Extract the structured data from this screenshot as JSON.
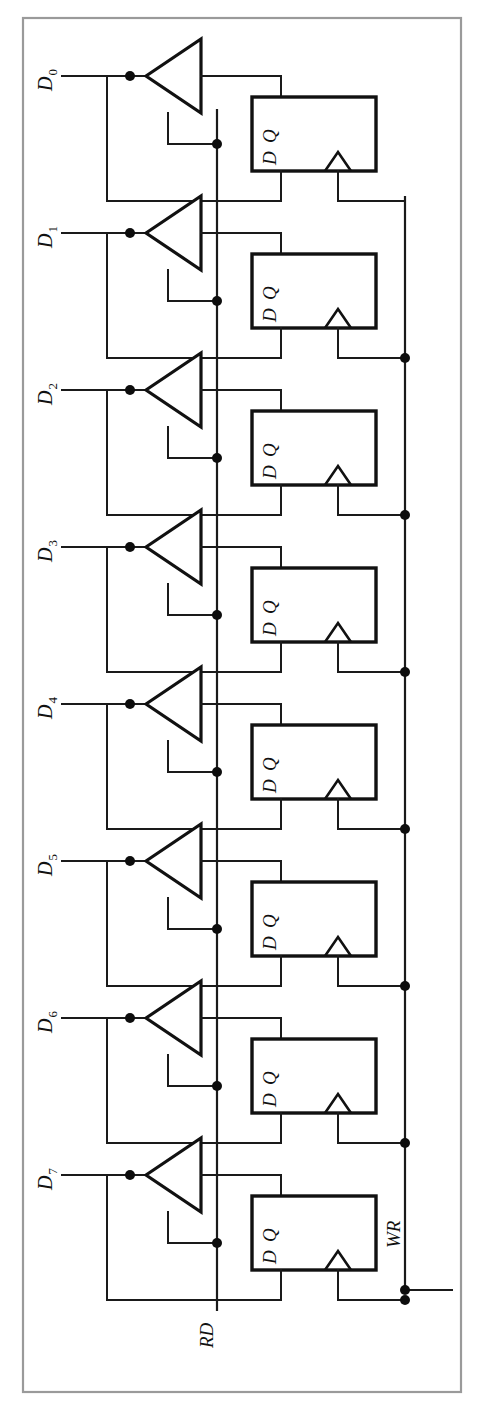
{
  "figure": {
    "kind": "circuit-schematic",
    "orientation": "rotated-90-ccw",
    "background_color": "#ffffff",
    "frame_color": "#9a9a9a",
    "wire_color": "#1a1a1a",
    "symbol_color": "#111111"
  },
  "frame": {
    "x": 23,
    "y": 18,
    "width": 438,
    "height": 1374
  },
  "geometry": {
    "unit_count": 8,
    "first_unit_y": 76,
    "unit_pitch": 157,
    "data_line_start_x": 62,
    "data_dot_x": 130,
    "buffer_tip_x": 146,
    "buffer_back_x": 201,
    "buffer_half_height": 37,
    "rd_bus_x": 217,
    "ff_left_x": 252,
    "ff_right_x": 376,
    "ff_top_offset": 21,
    "ff_height": 74,
    "wr_bus_x": 405,
    "wr_bus_end_x": 452,
    "clk_wedge_center_x": 338,
    "q_tap_x": 281,
    "d_tap_x": 281,
    "feedback_left_x": 107
  },
  "buses": [
    {
      "name": "RD",
      "label": "RD",
      "axis": "vertical",
      "x": 217,
      "y_top": 110,
      "y_bottom": 1310,
      "label_x": 213,
      "label_y": 1348,
      "description": "read-enable bus driving all tri-state buffer enables"
    },
    {
      "name": "WR",
      "label": "WR",
      "axis": "vertical",
      "x": 405,
      "y_top": 197,
      "y_bottom": 1290,
      "label_x": 400,
      "label_y": 1248,
      "description": "write-clock bus driving all flip-flop clock inputs"
    }
  ],
  "bus_terminal": {
    "name": "wr-terminal",
    "x": 452,
    "y": 1290
  },
  "data_lines": [
    {
      "id": "D0",
      "label": "D",
      "subscript": "0",
      "index": 0,
      "y": 76
    },
    {
      "id": "D1",
      "label": "D",
      "subscript": "1",
      "index": 1,
      "y": 233
    },
    {
      "id": "D2",
      "label": "D",
      "subscript": "2",
      "index": 2,
      "y": 390
    },
    {
      "id": "D3",
      "label": "D",
      "subscript": "3",
      "index": 3,
      "y": 547
    },
    {
      "id": "D4",
      "label": "D",
      "subscript": "4",
      "index": 4,
      "y": 704
    },
    {
      "id": "D5",
      "label": "D",
      "subscript": "5",
      "index": 5,
      "y": 861
    },
    {
      "id": "D6",
      "label": "D",
      "subscript": "6",
      "index": 6,
      "y": 1018
    },
    {
      "id": "D7",
      "label": "D",
      "subscript": "7",
      "index": 7,
      "y": 1175
    }
  ],
  "components": {
    "buffer": {
      "type": "tri-state-buffer",
      "name": "tri-state-buffer",
      "count": 8,
      "enable_source": "RD"
    },
    "flipflop": {
      "type": "d-flip-flop",
      "name": "d-flip-flop",
      "count": 8,
      "pin_q": "Q",
      "pin_d": "D",
      "clock_source": "WR",
      "clock_symbol": "edge-triangle"
    }
  },
  "junction_dots": {
    "data_tap": "on each data line at x=130",
    "enable_tap": "on RD bus at each buffer enable",
    "clock_tap": "on WR bus at each flip-flop clock (units 1-7)"
  }
}
